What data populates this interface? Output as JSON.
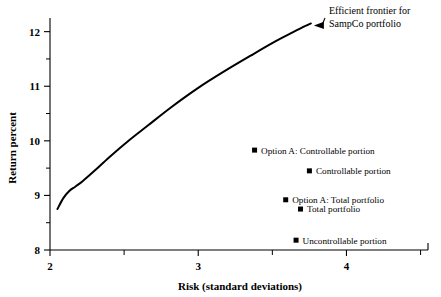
{
  "chart_data": {
    "type": "line",
    "title": "",
    "subtitle": "",
    "xlabel": "Risk (standard deviations)",
    "ylabel": "Return percent",
    "xlim": [
      2,
      4.55
    ],
    "ylim": [
      8,
      12.25
    ],
    "grid": false,
    "legend_position": "none",
    "x_ticks": [
      "2",
      "3",
      "4"
    ],
    "x_tick_values": [
      2,
      3,
      4
    ],
    "x_minor_tick_values": [
      2.5,
      3.5,
      4.5
    ],
    "y_ticks": [
      "8",
      "9",
      "10",
      "11",
      "12"
    ],
    "y_tick_values": [
      8,
      9,
      10,
      11,
      12
    ],
    "y_minor_tick_values": [
      8.5,
      9.5,
      10.5,
      11.5
    ],
    "series": [
      {
        "name": "Efficient frontier for SampCo portfolio",
        "type": "line",
        "x": [
          2.05,
          2.09,
          2.13,
          2.17,
          2.22,
          2.3,
          2.4,
          2.52,
          2.66,
          2.82,
          3.0,
          3.18,
          3.36,
          3.52,
          3.64,
          3.72,
          3.76
        ],
        "y": [
          8.75,
          8.95,
          9.08,
          9.16,
          9.26,
          9.45,
          9.7,
          9.98,
          10.28,
          10.62,
          10.97,
          11.28,
          11.57,
          11.82,
          11.99,
          12.1,
          12.15
        ]
      }
    ],
    "points": [
      {
        "label": "Option A:  Controllable portion",
        "x": 3.38,
        "y": 9.83,
        "label_anchor": "start",
        "marker": "square"
      },
      {
        "label": "Controllable portion",
        "x": 3.75,
        "y": 9.45,
        "label_anchor": "start",
        "marker": "square"
      },
      {
        "label": "Option A:  Total portfolio",
        "x": 3.59,
        "y": 8.92,
        "label_anchor": "start",
        "marker": "square"
      },
      {
        "label": "Total portfolio",
        "x": 3.69,
        "y": 8.75,
        "label_anchor": "start",
        "marker": "square"
      },
      {
        "label": "Uncontrollable portion",
        "x": 3.66,
        "y": 8.18,
        "label_anchor": "start",
        "marker": "square"
      }
    ],
    "annotations": [
      {
        "text_line1": "Efficient frontier for",
        "text_line2": "SampCo portfolio",
        "points_to_x": 3.76,
        "points_to_y": 12.15,
        "arrow": true
      }
    ],
    "colors": {
      "line": "#000000",
      "marker": "#000000",
      "axis": "#000000",
      "text": "#000000",
      "background": "#ffffff"
    }
  }
}
